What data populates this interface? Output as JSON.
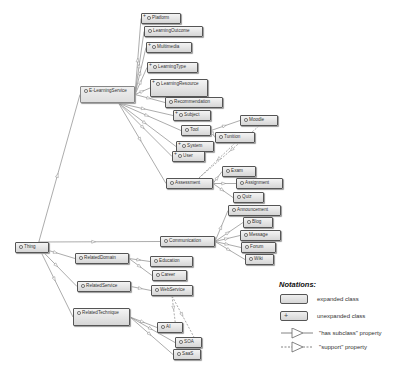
{
  "diagram": {
    "root": "Thing",
    "nodes": [
      {
        "id": "platform",
        "label": "Platform",
        "x": 141,
        "y": 13,
        "w": 40,
        "h": 11,
        "unexpanded": true
      },
      {
        "id": "learningoutcome",
        "label": "LearningOutcome",
        "x": 144,
        "y": 26,
        "w": 59,
        "h": 11,
        "unexpanded": false
      },
      {
        "id": "multimedia",
        "label": "Multimedia",
        "x": 146,
        "y": 42,
        "w": 46,
        "h": 11,
        "unexpanded": true
      },
      {
        "id": "learningtype",
        "label": "LearningType",
        "x": 147,
        "y": 62,
        "w": 51,
        "h": 11,
        "unexpanded": true
      },
      {
        "id": "learningresource",
        "label": "LearningResource",
        "x": 150,
        "y": 79,
        "w": 58,
        "h": 18,
        "unexpanded": true
      },
      {
        "id": "elearningservice",
        "label": "E-LearningService",
        "x": 80,
        "y": 86,
        "w": 55,
        "h": 17,
        "unexpanded": false,
        "selected": true
      },
      {
        "id": "recommendation",
        "label": "Recommendation",
        "x": 165,
        "y": 97,
        "w": 58,
        "h": 11,
        "unexpanded": false
      },
      {
        "id": "subject",
        "label": "Subject",
        "x": 173,
        "y": 110,
        "w": 38,
        "h": 11,
        "unexpanded": true
      },
      {
        "id": "tool",
        "label": "Tool",
        "x": 181,
        "y": 125,
        "w": 30,
        "h": 11,
        "unexpanded": false
      },
      {
        "id": "moodle",
        "label": "Moodle",
        "x": 240,
        "y": 115,
        "w": 38,
        "h": 11,
        "unexpanded": false
      },
      {
        "id": "tunition",
        "label": "Tunition",
        "x": 215,
        "y": 132,
        "w": 40,
        "h": 11,
        "unexpanded": false
      },
      {
        "id": "system",
        "label": "System",
        "x": 176,
        "y": 141,
        "w": 38,
        "h": 11,
        "unexpanded": true
      },
      {
        "id": "user",
        "label": "User",
        "x": 172,
        "y": 151,
        "w": 33,
        "h": 11,
        "unexpanded": true
      },
      {
        "id": "exam",
        "label": "Exam",
        "x": 222,
        "y": 166,
        "w": 34,
        "h": 11,
        "unexpanded": false
      },
      {
        "id": "assessment",
        "label": "Assessment",
        "x": 166,
        "y": 178,
        "w": 47,
        "h": 11,
        "unexpanded": false
      },
      {
        "id": "assignment",
        "label": "Assignment",
        "x": 236,
        "y": 178,
        "w": 47,
        "h": 11,
        "unexpanded": false
      },
      {
        "id": "quiz",
        "label": "Quiz",
        "x": 233,
        "y": 192,
        "w": 31,
        "h": 11,
        "unexpanded": false
      },
      {
        "id": "announcement",
        "label": "Announcement",
        "x": 228,
        "y": 205,
        "w": 53,
        "h": 11,
        "unexpanded": false
      },
      {
        "id": "blog",
        "label": "Blog",
        "x": 243,
        "y": 217,
        "w": 30,
        "h": 11,
        "unexpanded": false
      },
      {
        "id": "message",
        "label": "Message",
        "x": 240,
        "y": 230,
        "w": 41,
        "h": 11,
        "unexpanded": false
      },
      {
        "id": "forum",
        "label": "Forum",
        "x": 241,
        "y": 242,
        "w": 35,
        "h": 11,
        "unexpanded": false
      },
      {
        "id": "wiki",
        "label": "Wiki",
        "x": 245,
        "y": 254,
        "w": 29,
        "h": 11,
        "unexpanded": false
      },
      {
        "id": "communication",
        "label": "Communication",
        "x": 160,
        "y": 236,
        "w": 55,
        "h": 11,
        "unexpanded": false
      },
      {
        "id": "thing",
        "label": "Thing",
        "x": 15,
        "y": 242,
        "w": 34,
        "h": 11,
        "unexpanded": false
      },
      {
        "id": "relateddomain",
        "label": "RelatedDomain",
        "x": 75,
        "y": 253,
        "w": 54,
        "h": 11,
        "unexpanded": false
      },
      {
        "id": "education",
        "label": "Education",
        "x": 150,
        "y": 256,
        "w": 43,
        "h": 11,
        "unexpanded": false
      },
      {
        "id": "career",
        "label": "Career",
        "x": 152,
        "y": 270,
        "w": 35,
        "h": 11,
        "unexpanded": false
      },
      {
        "id": "relatedservice",
        "label": "RelatedService",
        "x": 77,
        "y": 281,
        "w": 54,
        "h": 11,
        "unexpanded": false
      },
      {
        "id": "webservice",
        "label": "WebService",
        "x": 151,
        "y": 285,
        "w": 42,
        "h": 11,
        "unexpanded": false
      },
      {
        "id": "relatedtechnique",
        "label": "RelatedTechnique",
        "x": 73,
        "y": 308,
        "w": 57,
        "h": 18,
        "unexpanded": false
      },
      {
        "id": "ai",
        "label": "AI",
        "x": 157,
        "y": 322,
        "w": 26,
        "h": 11,
        "unexpanded": false
      },
      {
        "id": "soa",
        "label": "SOA",
        "x": 175,
        "y": 337,
        "w": 27,
        "h": 11,
        "unexpanded": false
      },
      {
        "id": "saas",
        "label": "SaaS",
        "x": 173,
        "y": 349,
        "w": 28,
        "h": 11,
        "unexpanded": false
      }
    ],
    "edges": [
      {
        "from": "thing",
        "to": "elearningservice",
        "type": "subclass"
      },
      {
        "from": "thing",
        "to": "relateddomain",
        "type": "subclass"
      },
      {
        "from": "thing",
        "to": "relatedservice",
        "type": "subclass"
      },
      {
        "from": "thing",
        "to": "relatedtechnique",
        "type": "subclass"
      },
      {
        "from": "thing",
        "to": "communication",
        "type": "subclass"
      },
      {
        "from": "elearningservice",
        "to": "platform",
        "type": "subclass"
      },
      {
        "from": "elearningservice",
        "to": "learningoutcome",
        "type": "subclass"
      },
      {
        "from": "elearningservice",
        "to": "multimedia",
        "type": "subclass"
      },
      {
        "from": "elearningservice",
        "to": "learningtype",
        "type": "subclass"
      },
      {
        "from": "elearningservice",
        "to": "learningresource",
        "type": "subclass"
      },
      {
        "from": "elearningservice",
        "to": "recommendation",
        "type": "subclass"
      },
      {
        "from": "elearningservice",
        "to": "subject",
        "type": "subclass"
      },
      {
        "from": "elearningservice",
        "to": "tool",
        "type": "subclass"
      },
      {
        "from": "elearningservice",
        "to": "system",
        "type": "subclass"
      },
      {
        "from": "elearningservice",
        "to": "user",
        "type": "subclass"
      },
      {
        "from": "elearningservice",
        "to": "assessment",
        "type": "subclass"
      },
      {
        "from": "tool",
        "to": "moodle",
        "type": "subclass"
      },
      {
        "from": "tool",
        "to": "tunition",
        "type": "subclass"
      },
      {
        "from": "assessment",
        "to": "exam",
        "type": "subclass"
      },
      {
        "from": "assessment",
        "to": "assignment",
        "type": "subclass"
      },
      {
        "from": "assessment",
        "to": "quiz",
        "type": "subclass"
      },
      {
        "from": "communication",
        "to": "announcement",
        "type": "subclass"
      },
      {
        "from": "communication",
        "to": "blog",
        "type": "subclass"
      },
      {
        "from": "communication",
        "to": "message",
        "type": "subclass"
      },
      {
        "from": "communication",
        "to": "forum",
        "type": "subclass"
      },
      {
        "from": "communication",
        "to": "wiki",
        "type": "subclass"
      },
      {
        "from": "relateddomain",
        "to": "education",
        "type": "subclass"
      },
      {
        "from": "relateddomain",
        "to": "career",
        "type": "subclass"
      },
      {
        "from": "relatedservice",
        "to": "webservice",
        "type": "subclass"
      },
      {
        "from": "relatedtechnique",
        "to": "ai",
        "type": "subclass"
      },
      {
        "from": "relatedtechnique",
        "to": "soa",
        "type": "subclass"
      },
      {
        "from": "relatedtechnique",
        "to": "saas",
        "type": "subclass"
      },
      {
        "from": "moodle",
        "to": "assessment",
        "type": "support"
      },
      {
        "from": "tunition",
        "to": "assessment",
        "type": "support"
      },
      {
        "from": "webservice",
        "to": "ai",
        "type": "support"
      },
      {
        "from": "webservice",
        "to": "soa",
        "type": "support"
      }
    ]
  },
  "legend": {
    "title": "Notations:",
    "items": [
      {
        "kind": "expanded",
        "label": "expanded class"
      },
      {
        "kind": "unexpanded",
        "label": "unexpanded class",
        "glyph": "+"
      },
      {
        "kind": "subclass",
        "label": "\"has subclass\" property"
      },
      {
        "kind": "support",
        "label": "\"support\" property"
      }
    ]
  }
}
